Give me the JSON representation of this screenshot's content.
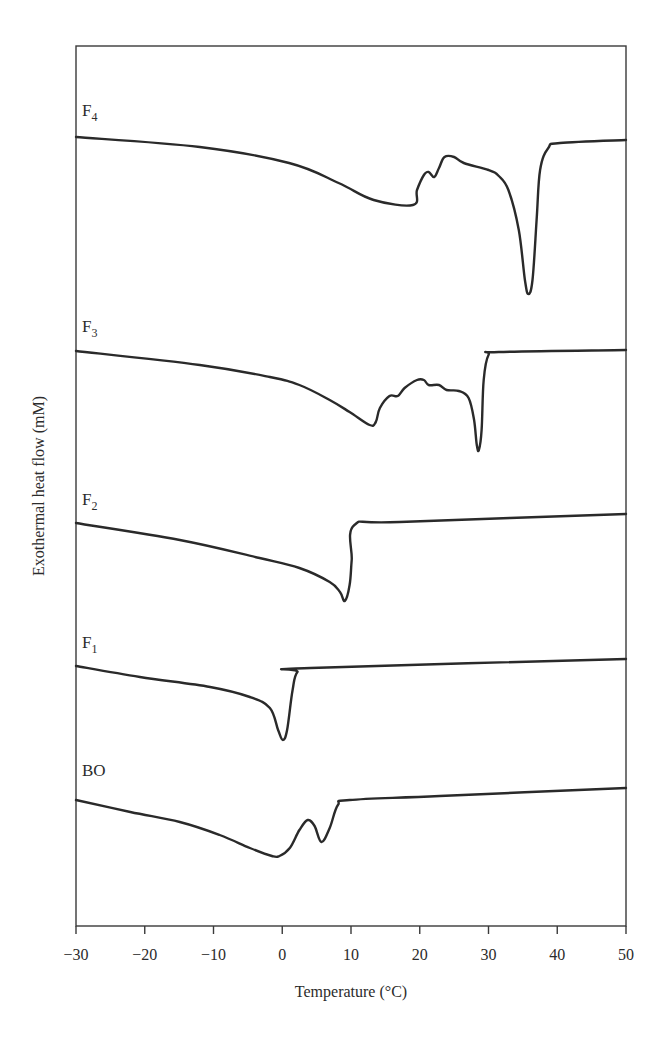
{
  "chart_data": {
    "type": "line",
    "title": "",
    "xlabel": "Temperature (°C)",
    "ylabel": "Exothermal heat flow (mM)",
    "xlim": [
      -30,
      50
    ],
    "x_ticks": [
      -30,
      -20,
      -10,
      0,
      10,
      20,
      30,
      40,
      50
    ],
    "x_tick_labels": [
      "−30",
      "−20",
      "−10",
      "0",
      "10",
      "20",
      "30",
      "40",
      "50"
    ],
    "y_ticks": [],
    "grid": false,
    "legend": "inline labels at left above each curve",
    "note": "Curves vertically offset (stacked); y values are relative heat flow in arbitrary units (higher = more exothermic), with each curve's baseline offset.",
    "series": [
      {
        "name": "F4",
        "label_main": "F",
        "label_sub": "4",
        "label_pos": [
          82,
          116
        ],
        "x": [
          -30,
          -12,
          1,
          8.2,
          13.3,
          19,
          19.6,
          20.6,
          21.3,
          22.1,
          22.8,
          23.6,
          25,
          26.4,
          30,
          31.5,
          32.9,
          34.4,
          35.3,
          35.8,
          36.4,
          37,
          37.5,
          38.7,
          40.4,
          50
        ],
        "px_y": [
          137,
          147,
          163,
          183,
          200,
          205,
          190,
          175,
          172,
          177,
          168,
          157,
          157,
          163,
          170,
          176,
          190,
          230,
          280,
          294,
          280,
          220,
          170,
          148,
          143,
          140
        ]
      },
      {
        "name": "F3",
        "label_main": "F",
        "label_sub": "3",
        "label_pos": [
          82,
          332
        ],
        "x": [
          -30,
          -12,
          -1.8,
          2.5,
          6.9,
          9.8,
          12.7,
          13.6,
          14.2,
          15.6,
          16.8,
          17.8,
          19.6,
          20.6,
          21.3,
          22.8,
          23.9,
          25.7,
          27.1,
          27.9,
          28.3,
          28.6,
          29,
          29.3,
          30,
          31.5,
          50
        ],
        "px_y": [
          351,
          365,
          377,
          385,
          400,
          412,
          425,
          422,
          408,
          396,
          396,
          388,
          380,
          380,
          385,
          385,
          390,
          391,
          398,
          420,
          445,
          450,
          430,
          380,
          355,
          352,
          350
        ]
      },
      {
        "name": "F2",
        "label_main": "F",
        "label_sub": "2",
        "label_pos": [
          82,
          505
        ],
        "x": [
          -30,
          -14.9,
          -3.3,
          2.5,
          6.9,
          8.4,
          9.1,
          9.8,
          10.1,
          10.5,
          17.1,
          50
        ],
        "px_y": [
          523,
          540,
          558,
          568,
          582,
          592,
          601,
          585,
          560,
          525,
          522,
          514
        ]
      },
      {
        "name": "F1",
        "label_main": "F",
        "label_sub": "1",
        "label_pos": [
          82,
          648
        ],
        "x": [
          -30,
          -20.7,
          -10.5,
          -4.7,
          -1.8,
          -0.6,
          0.1,
          0.7,
          1.5,
          2.2,
          4.1,
          50
        ],
        "px_y": [
          666,
          677,
          687,
          697,
          708,
          730,
          740,
          730,
          690,
          672,
          668,
          659
        ]
      },
      {
        "name": "BO",
        "label_main": "BO",
        "label_sub": "",
        "label_pos": [
          82,
          776
        ],
        "x": [
          -30,
          -22.1,
          -14.9,
          -9.1,
          -4.7,
          -1.5,
          -0.4,
          1.1,
          2.5,
          3.7,
          4.7,
          5.7,
          6.9,
          8.1,
          9.8,
          22.9,
          50
        ],
        "px_y": [
          800,
          812,
          822,
          835,
          848,
          856,
          856,
          848,
          830,
          820,
          826,
          842,
          828,
          805,
          800,
          796,
          788
        ]
      }
    ],
    "peaks": {
      "F4": {
        "main_endotherm_C": 36.0,
        "shoulder_C": 20.0
      },
      "F3": {
        "main_endotherm_C": 29.0,
        "shoulder_C": 14.5
      },
      "F2": {
        "main_endotherm_C": 10.5
      },
      "F1": {
        "main_endotherm_C": 5.0
      },
      "BO": {
        "endotherms_C": [
          8.0,
          15.5
        ],
        "exo_bump_C": 12.5
      }
    }
  },
  "layout": {
    "plot_px": {
      "left": 76,
      "right": 626,
      "top": 46,
      "bottom": 926
    },
    "colors": {
      "line": "#2a2a2a",
      "frame": "#3a3a3a",
      "text": "#2b2b2b",
      "background": "#ffffff"
    }
  }
}
